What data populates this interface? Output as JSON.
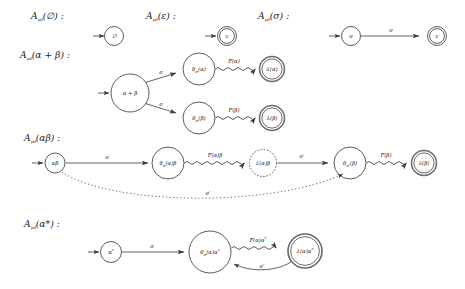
{
  "figure": {
    "title_prefix": "A",
    "title_sub": "pd",
    "background": "#ffffff",
    "stroke_color": "#3a3a3a",
    "text_color": "#222222"
  },
  "rows": [
    {
      "id": "row-empty",
      "caption": "𝒜ₚₔ(∅) :",
      "caption_main": "A",
      "caption_sub": "pd",
      "caption_arg": "(∅) :",
      "nodes": [
        {
          "name": "state-emptyset",
          "label": "∅",
          "accepting": false,
          "dashed": false
        }
      ],
      "edges": []
    },
    {
      "id": "row-epsilon",
      "caption_main": "A",
      "caption_sub": "pd",
      "caption_arg": "(ε) :",
      "nodes": [
        {
          "name": "state-epsilon",
          "label": "ε",
          "accepting": true,
          "dashed": false
        }
      ],
      "edges": []
    },
    {
      "id": "row-sigma",
      "caption_main": "A",
      "caption_sub": "pd",
      "caption_arg": "(σ) :",
      "nodes": [
        {
          "name": "state-sigma",
          "label": "σ",
          "accepting": false,
          "dashed": false
        },
        {
          "name": "state-epsilon",
          "label": "ε",
          "accepting": true,
          "dashed": false
        }
      ],
      "edges": [
        {
          "name": "edge-sigma",
          "label": "σ",
          "style": "solid"
        }
      ]
    },
    {
      "id": "row-union",
      "caption_main": "A",
      "caption_sub": "pd",
      "caption_arg": "(α + β) :",
      "nodes": [
        {
          "name": "state-alpha-plus-beta",
          "label": "α + β",
          "accepting": false,
          "dashed": false
        },
        {
          "name": "state-theta-sigma-alpha",
          "label": "θσ(α)",
          "accepting": false,
          "dashed": false
        },
        {
          "name": "state-theta-sigma-beta",
          "label": "θσ(β)",
          "accepting": false,
          "dashed": false
        },
        {
          "name": "state-lambda-alpha",
          "label": "λ(α)",
          "accepting": true,
          "dashed": false
        },
        {
          "name": "state-lambda-beta",
          "label": "λ(β)",
          "accepting": true,
          "dashed": false
        }
      ],
      "edges": [
        {
          "name": "edge-sigma-upper",
          "label": "σ",
          "style": "solid"
        },
        {
          "name": "edge-sigma-lower",
          "label": "σ",
          "style": "solid"
        },
        {
          "name": "edge-F-alpha",
          "label": "F(α)",
          "style": "squiggle"
        },
        {
          "name": "edge-F-beta",
          "label": "F(β)",
          "style": "squiggle"
        }
      ]
    },
    {
      "id": "row-concat",
      "caption_main": "A",
      "caption_sub": "pd",
      "caption_arg": "(αβ) :",
      "nodes": [
        {
          "name": "state-alpha-beta",
          "label": "αβ",
          "accepting": false,
          "dashed": false
        },
        {
          "name": "state-theta-sigma-alpha-beta",
          "label": "θσ(α)β",
          "accepting": false,
          "dashed": false
        },
        {
          "name": "state-lambda-alpha-beta",
          "label": "λ(α)β",
          "accepting": false,
          "dashed": true
        },
        {
          "name": "state-theta-sigmaprime-beta",
          "label": "θσ′(β)",
          "accepting": false,
          "dashed": false
        },
        {
          "name": "state-lambda-beta",
          "label": "λ(β)",
          "accepting": true,
          "dashed": false
        }
      ],
      "edges": [
        {
          "name": "edge-sigma",
          "label": "σ",
          "style": "solid"
        },
        {
          "name": "edge-F-alpha-beta",
          "label": "F(α)β",
          "style": "squiggle"
        },
        {
          "name": "edge-sigma-prime",
          "label": "σ′",
          "style": "solid"
        },
        {
          "name": "edge-F-beta",
          "label": "F(β)",
          "style": "squiggle"
        },
        {
          "name": "edge-sigma-prime-bypass",
          "label": "σ′",
          "style": "dotted"
        }
      ]
    },
    {
      "id": "row-star",
      "caption_main": "A",
      "caption_sub": "pd",
      "caption_arg": "(α*) :",
      "nodes": [
        {
          "name": "state-alpha-star",
          "label": "α*",
          "accepting": false,
          "dashed": false
        },
        {
          "name": "state-theta-sigma-alpha-star",
          "label": "θσ(α)α*",
          "accepting": false,
          "dashed": false
        },
        {
          "name": "state-lambda-alpha-star",
          "label": "λ(α)α*",
          "accepting": true,
          "dashed": false
        }
      ],
      "edges": [
        {
          "name": "edge-sigma",
          "label": "σ",
          "style": "solid"
        },
        {
          "name": "edge-F-alpha-star",
          "label": "F(α)α*",
          "style": "squiggle"
        },
        {
          "name": "edge-sigma-prime-loopback",
          "label": "σ′",
          "style": "solid"
        }
      ]
    }
  ],
  "captions": {
    "c1": "A",
    "c1sub": "pd",
    "c1arg": "(∅) :",
    "c2arg": "(ε) :",
    "c3arg": "(σ) :",
    "c4arg": "(α + β) :",
    "c5arg": "(αβ) :",
    "c6arg": "(α*) :"
  },
  "node_labels": {
    "emptyset": "∅",
    "epsilon": "ε",
    "sigma": "σ",
    "alpha_plus_beta": "α + β",
    "theta_sigma_alpha": "θ",
    "theta_sigma_alpha_arg": "(α)",
    "theta_sigma_beta_arg": "(β)",
    "lambda_alpha": "λ(α)",
    "lambda_beta": "λ(β)",
    "alpha_beta": "αβ",
    "theta_sigma_alpha_beta_arg": "(α)β",
    "lambda_alpha_beta": "λ(α)β",
    "theta_sigmaprime_beta_arg": "(β)",
    "alpha_star": "α",
    "star": "*",
    "theta_sigma_alpha_star_arg": "(α)α",
    "lambda_alpha_star": "λ(α)α"
  },
  "edge_labels": {
    "sigma": "σ",
    "sigma_prime": "σ′",
    "F_alpha": "F(α)",
    "F_beta": "F(β)",
    "F_alpha_beta": "F(α)β",
    "F_alpha_star": "F(α)α"
  }
}
